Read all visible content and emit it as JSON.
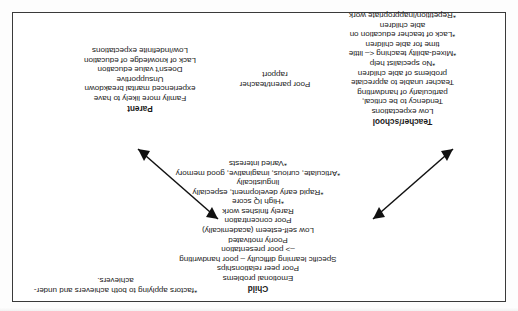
{
  "document": {
    "orientation": "upside-down",
    "page_background": "#fdfdfd",
    "frame_border_color": "#3a3a3a",
    "arrow_color": "#111111"
  },
  "footnote": {
    "line1": "*factors applying to both",
    "line2": "achievers and under-achievers."
  },
  "blocks": {
    "child": {
      "heading": "Child",
      "lines": [
        "Emotional problems",
        "Poor peer relationships",
        "Specific learning difficulty – poor handwriting",
        "–> poor presentation",
        "Poorly motivated",
        "Low self-esteem (academically)",
        "Poor concentration",
        "Rarely finishes work",
        "*High IQ score",
        "*Rapid early development, especially",
        "linguistically",
        "*Articulate, curious, imaginative, good memory",
        "*Varied interests"
      ]
    },
    "teacher_school": {
      "heading": "Teacher/school",
      "lines": [
        "Low expectations",
        "Tendency to be critical,",
        "particularly of handwriting",
        "Teacher unable to appreciate",
        "problems of able children",
        "*No specialist help",
        "*Mixed-ability teaching <– little",
        "time for able children",
        "*Lack of teacher education on",
        "able children",
        "*Repetition/inappropriate work"
      ]
    },
    "parent": {
      "heading": "Parent",
      "lines": [
        "Family more likely to have",
        "experienced marital breakdown",
        "Unsupportive",
        "Doesn't value education",
        "Lack of knowledge of education",
        "Low/indefinite expectations"
      ]
    },
    "rapport": {
      "heading": "",
      "lines": [
        "Poor parent/teacher",
        "rapport"
      ]
    }
  },
  "arrows": [
    {
      "name": "child-to-teacher-school",
      "style": "double-headed",
      "from": "Child",
      "to": "Teacher/school"
    },
    {
      "name": "child-to-parent",
      "style": "double-headed",
      "from": "Child",
      "to": "Parent"
    }
  ]
}
